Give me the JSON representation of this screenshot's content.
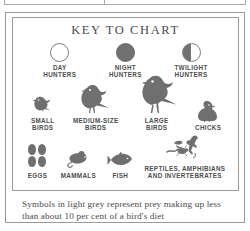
{
  "figure": {
    "title": "KEY TO CHART",
    "caption": "Symbols in light grey represent prey making up less than about 10 per cent of a bird's diet"
  },
  "hunters": [
    {
      "label": "DAY\nHUNTERS",
      "icon": "open-circle-icon",
      "fill": "none"
    },
    {
      "label": "NIGHT\nHUNTERS",
      "icon": "filled-circle-icon",
      "fill": "full"
    },
    {
      "label": "TWILIGHT\nHUNTERS",
      "icon": "half-filled-circle-icon",
      "fill": "half"
    }
  ],
  "prey_birds": [
    {
      "label": "SMALL\nBIRDS",
      "icon": "small-bird-icon"
    },
    {
      "label": "MEDIUM-SIZE\nBIRDS",
      "icon": "medium-bird-icon"
    },
    {
      "label": "LARGE\nBIRDS",
      "icon": "large-bird-icon"
    },
    {
      "label": "CHICKS",
      "icon": "chick-icon"
    }
  ],
  "prey_other": [
    {
      "label": "EGGS",
      "icon": "eggs-icon"
    },
    {
      "label": "MAMMALS",
      "icon": "mouse-icon"
    },
    {
      "label": "FISH",
      "icon": "fish-icon"
    },
    {
      "label": "REPTILES, AMPHIBIANS\nAND INVERTEBRATES",
      "icon": "reptiles-invertebrates-icon"
    }
  ],
  "colors": {
    "symbol_dark": "#6f6f6f",
    "border": "#9a9a9a",
    "text": "#4a4a4a",
    "background": "#ffffff"
  }
}
